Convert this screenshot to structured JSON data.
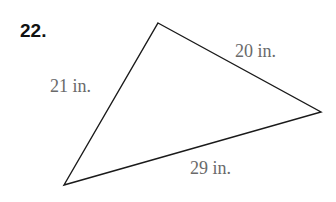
{
  "problem": {
    "number": "22."
  },
  "triangle": {
    "vertices": {
      "top": [
        158,
        23
      ],
      "right": [
        321,
        112
      ],
      "bottom_left": [
        64,
        185
      ]
    },
    "sides": {
      "left": "21 in.",
      "upper_right": "20 in.",
      "bottom": "29 in."
    }
  }
}
